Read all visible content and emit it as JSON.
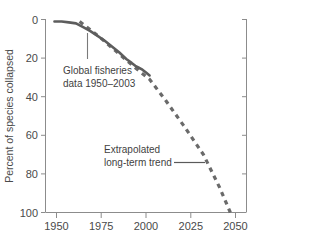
{
  "chart_data": {
    "type": "line",
    "title": "",
    "xlabel": "",
    "ylabel": "Percent of species collapsed",
    "xlim": [
      1945,
      2057
    ],
    "ylim": [
      0,
      100
    ],
    "y_inverted": true,
    "grid": false,
    "legend": "none",
    "x_ticks": [
      "1950",
      "1975",
      "2000",
      "2025",
      "2050"
    ],
    "x_tick_values": [
      1950,
      1975,
      2000,
      2025,
      2050
    ],
    "y_ticks": [
      "0",
      "20",
      "40",
      "60",
      "80",
      "100"
    ],
    "y_tick_values": [
      0,
      20,
      40,
      60,
      80,
      100
    ],
    "series": [
      {
        "name": "Global fisheries data 1950-2003",
        "style": "solid",
        "color": "#5d5d5d",
        "x": [
          1950,
          1954,
          1958,
          1962,
          1966,
          1970,
          1974,
          1978,
          1982,
          1986,
          1990,
          1993,
          1995,
          1997,
          1999,
          2001,
          2003
        ],
        "y": [
          1,
          1,
          1.5,
          2,
          4,
          6,
          8.5,
          11,
          14,
          17,
          20.5,
          22.5,
          24,
          25,
          26,
          27.5,
          29
        ]
      },
      {
        "name": "Extrapolated long-term trend",
        "style": "dashed",
        "color": "#6a6a6a",
        "x": [
          1964,
          1975,
          1985,
          1995,
          2003,
          2012,
          2022,
          2033,
          2042,
          2048
        ],
        "y": [
          1,
          9,
          17,
          25,
          31,
          42,
          55,
          70,
          87,
          100
        ]
      }
    ],
    "annotations": [
      {
        "id": "data-annotation",
        "line1": "Global fisheries",
        "line2": "data 1950–2003",
        "leader": "vertical"
      },
      {
        "id": "trend-annotation",
        "line1": "Extrapolated",
        "line2": "long-term trend",
        "leader": "horizontal"
      }
    ]
  },
  "axes": {
    "y_label": "Percent of species collapsed",
    "y_tick_0": "0",
    "y_tick_20": "20",
    "y_tick_40": "40",
    "y_tick_60": "60",
    "y_tick_80": "80",
    "y_tick_100": "100",
    "x_tick_1950": "1950",
    "x_tick_1975": "1975",
    "x_tick_2000": "2000",
    "x_tick_2025": "2025",
    "x_tick_2050": "2050"
  },
  "annotations": {
    "data_line1": "Global fisheries",
    "data_line2": "data 1950–2003",
    "trend_line1": "Extrapolated",
    "trend_line2": "long-term trend"
  },
  "colors": {
    "background": "#ffffff",
    "axis": "#8c8c8c",
    "solid_series": "#5d5d5d",
    "dashed_series": "#6a6a6a",
    "text": "#4a4a4a"
  }
}
